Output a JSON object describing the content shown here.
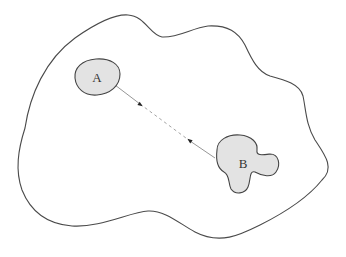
{
  "diagram": {
    "background": "#ffffff",
    "outer_region": {
      "stroke": "#4a4a4a",
      "fill": "none",
      "path": "M 25 128 C 30 95, 45 60, 75 38 C 95 24, 115 14, 128 15 C 145 16, 150 35, 162 37 C 178 38, 192 28, 208 26 C 228 25, 238 32, 245 45 C 252 60, 258 72, 270 76 C 285 80, 300 84, 303 96 C 306 110, 306 125, 315 140 C 325 155, 335 168, 322 180 C 310 195, 290 210, 260 225 C 240 235, 220 245, 195 232 C 180 224, 165 210, 148 211 C 130 212, 100 228, 72 226 C 45 224, 30 210, 22 190 C 15 170, 18 150, 25 128 Z"
    },
    "regions": [
      {
        "id": "A",
        "label": "A",
        "fill": "#e3e3e3",
        "stroke": "#444444",
        "path": "M 75 78 C 74 68, 82 60, 96 59 C 110 58, 120 64, 120 74 C 120 86, 110 94, 97 95 C 84 96, 76 88, 75 78 Z",
        "label_x": 97,
        "label_y": 82
      },
      {
        "id": "B",
        "label": "B",
        "fill": "#e3e3e3",
        "stroke": "#444444",
        "path": "M 217 150 C 217 140, 228 134, 240 135 C 252 136, 258 143, 257 150 C 256 156, 262 155, 270 154 C 279 154, 281 165, 276 172 C 272 178, 262 176, 255 172 C 249 170, 251 180, 248 187 C 245 194, 235 195, 231 189 C 228 183, 230 175, 224 172 C 217 168, 216 158, 217 150 Z",
        "label_x": 243,
        "label_y": 168
      }
    ],
    "connector": {
      "stroke": "#8a8a8a",
      "from": [
        115,
        85
      ],
      "to": [
        215,
        158
      ],
      "solid_segment_1": [
        [
          115,
          85
        ],
        [
          140,
          104
        ]
      ],
      "dashed_segment": [
        [
          140,
          104
        ],
        [
          190,
          141
        ]
      ],
      "solid_segment_2": [
        [
          190,
          141
        ],
        [
          215,
          158
        ]
      ],
      "dash": "3,3",
      "arrowheads": [
        {
          "at": [
            141,
            105
          ],
          "direction": "toward-B"
        },
        {
          "at": [
            189,
            140
          ],
          "direction": "toward-A"
        }
      ],
      "arrow_color": "#222222"
    }
  }
}
